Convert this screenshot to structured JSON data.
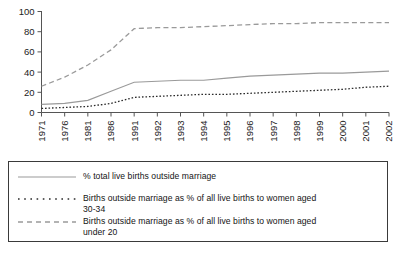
{
  "chart_data": {
    "type": "line",
    "title": "",
    "xlabel": "",
    "ylabel": "",
    "ylim": [
      0,
      100
    ],
    "yticks": [
      0,
      20,
      40,
      60,
      80,
      100
    ],
    "grid": false,
    "legend_position": "bottom",
    "categories": [
      "1971",
      "1976",
      "1981",
      "1986",
      "1991",
      "1992",
      "1993",
      "1994",
      "1995",
      "1996",
      "1997",
      "1998",
      "1999",
      "2000",
      "2001",
      "2002"
    ],
    "series": [
      {
        "name": "% total live births outside marriage",
        "style": "solid",
        "color": "#9a9a9a",
        "values": [
          8,
          9,
          12,
          21,
          30,
          31,
          32,
          32,
          34,
          36,
          37,
          38,
          39,
          39,
          40,
          41
        ]
      },
      {
        "name": "Births outside marriage as % of all live births to women aged 30-34",
        "style": "dotted",
        "color": "#2b2b2b",
        "values": [
          4,
          5,
          6,
          9,
          15,
          16,
          17,
          18,
          18,
          19,
          20,
          21,
          22,
          23,
          25,
          26
        ]
      },
      {
        "name": "Births outside marriage as % of all live births to women aged under 20",
        "style": "dashed",
        "color": "#9a9a9a",
        "values": [
          26,
          35,
          47,
          62,
          83,
          84,
          84,
          85,
          86,
          87,
          88,
          88,
          89,
          89,
          89,
          89
        ]
      }
    ]
  },
  "legend": {
    "items": [
      {
        "label": "% total live births outside marriage",
        "label_line2": "",
        "sample": "solid-line-sample"
      },
      {
        "label": "Births outside marriage as % of all live births to women aged",
        "label_line2": "30-34",
        "sample": "dotted-line-sample"
      },
      {
        "label": "Births outside marriage as % of all live births to women aged",
        "label_line2": "under 20",
        "sample": "dashed-line-sample"
      }
    ]
  }
}
